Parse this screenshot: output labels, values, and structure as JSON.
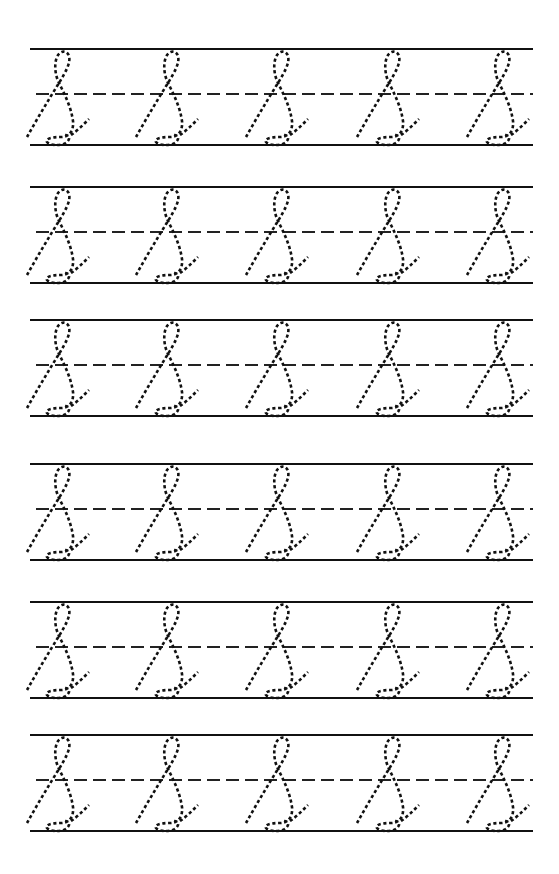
{
  "worksheet": {
    "type": "cursive-letter-tracing",
    "letter": "L",
    "letter_style": "cursive uppercase (dotted tracing)",
    "rows_count": 6,
    "letters_per_row": 5,
    "colors": {
      "background": "#ffffff",
      "line": "#111111",
      "glyph": "#111111"
    },
    "rows": [
      {
        "top_y": 49,
        "mid_y": 94,
        "base_y": 145
      },
      {
        "top_y": 187,
        "mid_y": 232,
        "base_y": 283
      },
      {
        "top_y": 320,
        "mid_y": 365,
        "base_y": 416
      },
      {
        "top_y": 464,
        "mid_y": 509,
        "base_y": 560
      },
      {
        "top_y": 602,
        "mid_y": 647,
        "base_y": 698
      },
      {
        "top_y": 735,
        "mid_y": 780,
        "base_y": 831
      }
    ],
    "line_x_start": 30,
    "line_x_end": 533,
    "letter_x_positions": [
      27,
      136,
      246,
      357,
      467
    ]
  }
}
